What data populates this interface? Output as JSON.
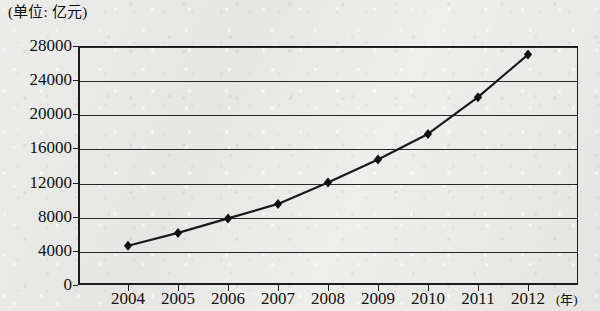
{
  "caption": {
    "unit_note": "(单位: 亿元)"
  },
  "axis": {
    "x_unit_label": "(年)",
    "y_ticks": [
      "0",
      "4000",
      "8000",
      "12000",
      "16000",
      "20000",
      "24000",
      "28000"
    ],
    "x_ticks": [
      "2004",
      "2005",
      "2006",
      "2007",
      "2008",
      "2009",
      "2010",
      "2011",
      "2012"
    ]
  },
  "style": {
    "line_color": "#1b1b1b",
    "marker_color": "#101010",
    "grid_color": "#262626",
    "paper_color": "#e8e8e6"
  },
  "chart_data": {
    "type": "line",
    "title": "",
    "subtitle": "",
    "xlabel": "(年)",
    "ylabel": "(单位: 亿元)",
    "categories": [
      "2004",
      "2005",
      "2006",
      "2007",
      "2008",
      "2009",
      "2010",
      "2011",
      "2012"
    ],
    "values": [
      4600,
      6100,
      7800,
      9500,
      12000,
      14700,
      17700,
      22000,
      27000
    ],
    "series": [
      {
        "name": "金额",
        "values": [
          4600,
          6100,
          7800,
          9500,
          12000,
          14700,
          17700,
          22000,
          27000
        ]
      }
    ],
    "ylim": [
      0,
      28000
    ],
    "ytick_values": [
      0,
      4000,
      8000,
      12000,
      16000,
      20000,
      24000,
      28000
    ],
    "grid": true,
    "grid_axis": "y",
    "legend": false,
    "markers": "diamond"
  }
}
